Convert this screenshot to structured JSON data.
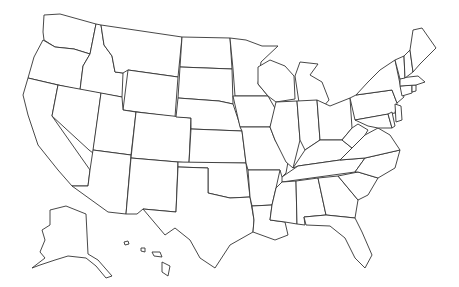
{
  "map": {
    "title": "",
    "type": "blank-outline",
    "region": "United States",
    "stroke_color": "#333333",
    "fill_color": "#ffffff",
    "labels": [],
    "insets": [
      "alaska",
      "hawaii"
    ]
  }
}
